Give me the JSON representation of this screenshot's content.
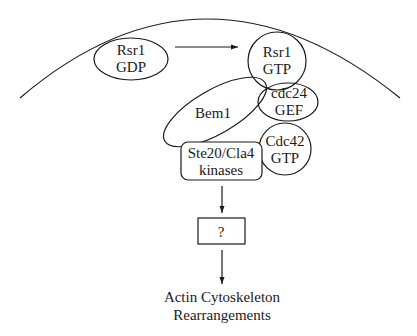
{
  "diagram": {
    "type": "signaling-pathway",
    "nodes": {
      "rsr1_gdp": {
        "line1": "Rsr1",
        "line2": "GDP"
      },
      "rsr1_gtp": {
        "line1": "Rsr1",
        "line2": "GTP"
      },
      "bem1": {
        "label": "Bem1"
      },
      "cdc24_gef": {
        "line1": "cdc24",
        "line2": "GEF"
      },
      "cdc42_gtp": {
        "line1": "Cdc42",
        "line2": "GTP"
      },
      "ste20_cla4": {
        "line1": "Ste20/Cla4",
        "line2": "kinases"
      },
      "unknown": {
        "label": "?"
      },
      "output": {
        "line1": "Actin Cytoskeleton",
        "line2": "Rearrangements"
      }
    },
    "edges": [
      {
        "from": "Rsr1 GDP",
        "to": "Rsr1 GTP"
      },
      {
        "from": "Ste20/Cla4 kinases",
        "to": "?"
      },
      {
        "from": "?",
        "to": "Actin Cytoskeleton Rearrangements"
      }
    ],
    "colors": {
      "stroke": "#1a1a1a",
      "background": "#ffffff"
    }
  }
}
